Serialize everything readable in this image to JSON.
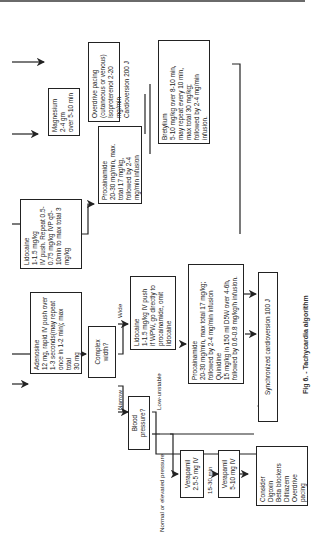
{
  "figure": {
    "caption": "Fig 6. - Tachycardia algorithm",
    "orientation": "rotated 90° counterclockwise"
  },
  "nodes": {
    "adenosine": "Adenosine\n12 mg, rapid IV push over\n1-3 seconds(may repeat\nonce in 1-2 min); max total\n30 mg",
    "complex_width": "Complex width?",
    "blood_pressure": "Blood pressure?",
    "lidocaine_wide": "Lidocaine\n   1-1.5 mg/kg IV push\nif WPW, go directly to\nprocainamide, omit lidocaine",
    "procainamide_quinidine": "Procainamide\n   20-30 mg/min, max total 17 mg/kg;\n   followed by 2-4 mg/min infusion\nQuinidine\n   15 mg/kg in 150 ml D5W   over 4-6h,\n   followed by 0.6-0.8  mg/kg/h infusion.",
    "lidocaine_top": "Lidocaine\n1-1.5 mg/kg\nIV push.  Repeat 0.5-\n0.75 mg/kg IVP q5-\n10min to max total 3\nmg/kg",
    "procainamide_top": "Procainamide\n20-30 mg/min, max.\ntotal 17 mg/kg,\nfollowed by 2-4\nmg/min infusion",
    "bretylium": "Bretylium\n5-10 mg/kg over 8-10 min,\nmay repeat every 10 min,\nmax total 30 mg/kg;\nfollowed by 2-4 mg/min\ninfusion.",
    "magnesium": "Magnesium 2-4 gm\nover 5-10 min",
    "overdrive": "Overdrive pacing\n(cutaneous or venous)\nIsoproterenol 2-20 mg/min\nCardioversion 200 J",
    "sync_cardioversion": "Synchronized cardioversion  100 J",
    "verapamil_1": "Verapamil\n2.5-5 mg IV",
    "verapamil_2": "Verapamil\n5-10 mg IV",
    "consider": "Consider\n  Digoxin\n  Beta blockers\n  Diltiazem\n  Overdrive\n  pacing"
  },
  "edge_labels": {
    "wide": "Wide",
    "narrow": "Narrow",
    "low_unstable": "Low-unstable",
    "normal_elevated": "Normal or elevated pressure",
    "interval": "15-30 min"
  },
  "colors": {
    "line": "#222222",
    "background": "#ffffff",
    "text": "#222222"
  }
}
